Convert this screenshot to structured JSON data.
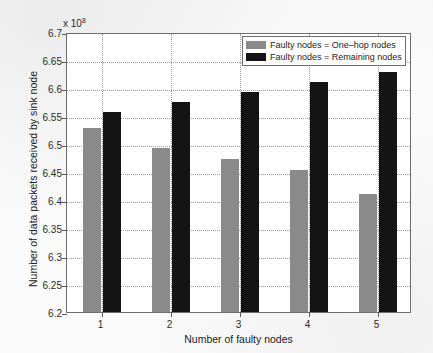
{
  "chart_data": {
    "type": "bar",
    "title": "",
    "subtitle": "",
    "xlabel": "Number of faulty nodes",
    "ylabel": "Number of data packets received by sink node",
    "y_multiplier_label": "x 10",
    "y_multiplier_exponent": "8",
    "categories": [
      "1",
      "2",
      "3",
      "4",
      "5"
    ],
    "ylim": [
      6.2,
      6.7
    ],
    "yticks": [
      "6.2",
      "6.25",
      "6.3",
      "6.35",
      "6.4",
      "6.45",
      "6.5",
      "6.55",
      "6.6",
      "6.65",
      "6.7"
    ],
    "ytick_values": [
      6.2,
      6.25,
      6.3,
      6.35,
      6.4,
      6.45,
      6.5,
      6.55,
      6.6,
      6.65,
      6.7
    ],
    "grid": true,
    "legend_position": "top-right",
    "series": [
      {
        "name": "Faulty nodes = One–hop nodes",
        "color": "#8a8a8a",
        "values": [
          6.528,
          6.492,
          6.473,
          6.453,
          6.411
        ]
      },
      {
        "name": "Faulty nodes = Remaining nodes",
        "color": "#141414",
        "values": [
          6.558,
          6.575,
          6.592,
          6.611,
          6.629
        ]
      }
    ]
  },
  "legend": {
    "items": [
      {
        "label": "Faulty nodes = One–hop nodes",
        "color": "#8a8a8a"
      },
      {
        "label": "Faulty nodes = Remaining nodes",
        "color": "#141414"
      }
    ]
  },
  "axes": {
    "x_title": "Number of faulty nodes",
    "y_title": "Number of data packets received by sink node",
    "y_exponent_prefix": "x 10",
    "y_exponent_power": "8"
  }
}
